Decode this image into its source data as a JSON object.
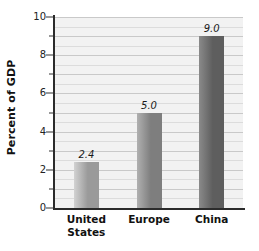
{
  "chart_data": {
    "type": "bar",
    "title": "",
    "subtitle": "",
    "xlabel": "",
    "ylabel": "Percent of GDP",
    "categories": [
      "United\nStates",
      "Europe",
      "China"
    ],
    "category_labels_flat": [
      "United States",
      "Europe",
      "China"
    ],
    "values": [
      2.4,
      5.0,
      9.0
    ],
    "value_labels": [
      "2.4",
      "5.0",
      "9.0"
    ],
    "ylim": [
      0,
      10
    ],
    "y_major_ticks": [
      0,
      2,
      4,
      6,
      8,
      10
    ],
    "y_major_tick_labels": [
      "0",
      "2",
      "4",
      "6",
      "8",
      "10"
    ],
    "y_minor_tick_interval": 1,
    "grid": "horizontal",
    "grid_interval": 0.5,
    "legend": "none",
    "bar_colors": [
      "#9a9a9a",
      "#7e7e7e",
      "#5e5e5e"
    ],
    "bar_gradient_light": [
      "#d2d2d2",
      "#b0b0b0",
      "#8a8a8a"
    ],
    "plot_background": "#f2f2f2",
    "axis_color": "#2b2b2b",
    "gridline_color": "#c9c9c9"
  },
  "axis": {
    "y_title": "Percent of GDP"
  }
}
